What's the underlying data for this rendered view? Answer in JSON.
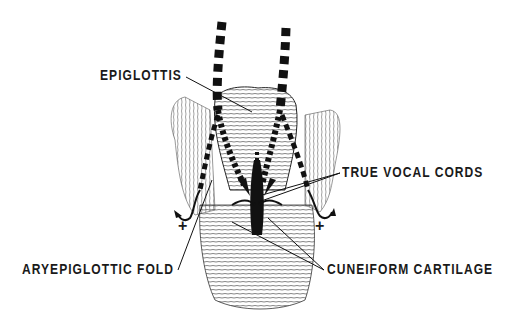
{
  "diagram": {
    "labels": {
      "epiglottis": "EPIGLOTTIS",
      "true_vocal_cords": "TRUE VOCAL CORDS",
      "aryepiglottic_fold": "ARYEPIGLOTTIC FOLD",
      "cuneiform_cartilage": "CUNEIFORM CARTILAGE"
    },
    "symbols": {
      "plus_left": "+",
      "plus_right": "+"
    },
    "colors": {
      "ink": "#1a1a1a",
      "background": "#ffffff"
    }
  }
}
